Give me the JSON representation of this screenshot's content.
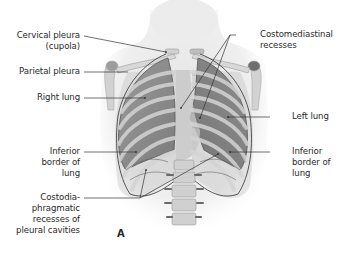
{
  "figure": {
    "panel_letter": "A",
    "labels": {
      "cervical_pleura": "Cervical pleura\n(cupola)",
      "parietal_pleura": "Parietal pleura",
      "right_lung": "Right lung",
      "inferior_border_left_side": "Inferior\nborder of\nlung",
      "costodiaphragmatic_recesses": "Costodia-\nphragmatic\nrecesses of\npleural cavities",
      "costomediastinal_recesses": "Costomediastinal\nrecesses",
      "left_lung": "Left lung",
      "inferior_border_right_side": "Inferior\nborder of\nlung"
    }
  },
  "colors": {
    "label_text": "#2a2a2a",
    "leader_line": "#333333",
    "skin": "#e8e8e8",
    "lung": "#8a8a8a",
    "rib": "#c8c8c8",
    "bone": "#d6d6d6"
  }
}
